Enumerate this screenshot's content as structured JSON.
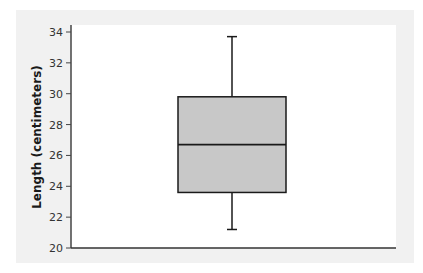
{
  "chart_data": {
    "type": "box",
    "title": "",
    "xlabel": "",
    "ylabel": "Length (centimeters)",
    "ylim": [
      20,
      34
    ],
    "yticks": [
      20,
      22,
      24,
      26,
      28,
      30,
      32,
      34
    ],
    "grid": false,
    "legend": null,
    "series": [
      {
        "name": "",
        "min": 21.2,
        "q1": 23.6,
        "median": 26.7,
        "q3": 29.8,
        "max": 33.7
      }
    ],
    "box_fill": "#c8c8c8",
    "line_color": "#1a1a1a"
  },
  "axis": {
    "ylabel": "Length (centimeters)",
    "ticks": [
      "20",
      "22",
      "24",
      "26",
      "28",
      "30",
      "32",
      "34"
    ]
  }
}
